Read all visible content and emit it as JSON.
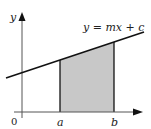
{
  "diagram": {
    "line_label": "y = mx + c",
    "y_axis_label": "y",
    "origin_label": "0",
    "x_tick_labels": [
      "a",
      "b"
    ],
    "colors": {
      "axis": "#555555",
      "line": "#111111",
      "shade": "#c8c8c8",
      "text": "#222222"
    }
  }
}
